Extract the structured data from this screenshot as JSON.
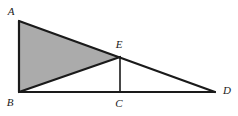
{
  "figure": {
    "kind": "geometry-diagram",
    "canvas": {
      "width": 238,
      "height": 116,
      "background": "#ffffff"
    },
    "style": {
      "stroke_color": "#1a1a1a",
      "stroke_width": 2.2,
      "thin_stroke_width": 1.6,
      "shaded_fill": "#ababab",
      "label_color": "#1a1a1a"
    },
    "points": [
      {
        "id": "A",
        "label": "A",
        "x": 19,
        "y": 21,
        "label_x": 11,
        "label_y": 11
      },
      {
        "id": "B",
        "label": "B",
        "x": 19,
        "y": 92,
        "label_x": 10,
        "label_y": 102
      },
      {
        "id": "C",
        "label": "C",
        "x": 120,
        "y": 92,
        "label_x": 119,
        "label_y": 103
      },
      {
        "id": "D",
        "label": "D",
        "x": 215,
        "y": 92,
        "label_x": 227,
        "label_y": 90
      },
      {
        "id": "E",
        "label": "E",
        "x": 120,
        "y": 57,
        "label_x": 119,
        "label_y": 44
      }
    ],
    "segments": [
      {
        "id": "AB",
        "from": "A",
        "to": "B",
        "weight": "thick"
      },
      {
        "id": "AD",
        "from": "A",
        "to": "D",
        "weight": "thick"
      },
      {
        "id": "BD",
        "from": "B",
        "to": "D",
        "weight": "thick"
      },
      {
        "id": "BE",
        "from": "B",
        "to": "E",
        "weight": "thick"
      },
      {
        "id": "EC",
        "from": "E",
        "to": "C",
        "weight": "thin"
      }
    ],
    "shaded_regions": [
      {
        "id": "ABE",
        "vertices": [
          "A",
          "B",
          "E"
        ],
        "fill": "#ababab"
      }
    ]
  }
}
